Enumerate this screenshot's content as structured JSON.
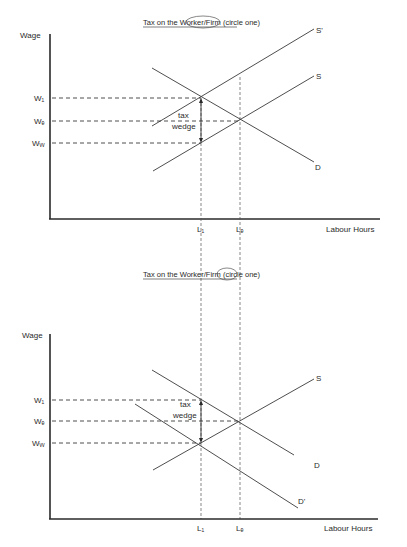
{
  "diagrams": [
    {
      "id": "top",
      "title_prefix": "Tax on the ",
      "title_option_a": "Worker",
      "title_sep": "/",
      "title_option_b": "Firm",
      "title_suffix": " (circle one)",
      "circled": "Worker",
      "y_axis_label": "Wage",
      "x_axis_label": "Labour Hours",
      "wage_labels": {
        "w1": "W₁",
        "we": "Wₑ",
        "ww": "Wᵥᵥ"
      },
      "quantity_labels": {
        "l1": "L₁",
        "le": "Lₑ"
      },
      "curve_labels": {
        "s_shifted": "S'",
        "s": "S",
        "d": "D"
      },
      "wedge_label_line1": "tax",
      "wedge_label_line2": "wedge"
    },
    {
      "id": "bottom",
      "title_prefix": "Tax on the ",
      "title_option_a": "Worker",
      "title_sep": "/",
      "title_option_b": "Firm",
      "title_suffix": " (circle one)",
      "circled": "Firm",
      "y_axis_label": "Wage",
      "x_axis_label": "Labour Hours",
      "wage_labels": {
        "w1": "W₁",
        "we": "Wₑ",
        "ww": "Wᵥᵥ"
      },
      "quantity_labels": {
        "l1": "L₁",
        "le": "Lₑ"
      },
      "curve_labels": {
        "s": "S",
        "d": "D",
        "d_shifted": "D'"
      },
      "wedge_label_line1": "tax",
      "wedge_label_line2": "wedge"
    }
  ]
}
